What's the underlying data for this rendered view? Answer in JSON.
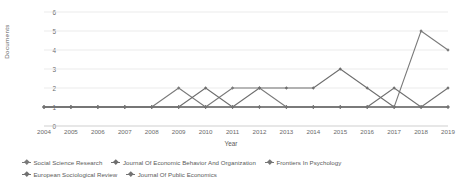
{
  "chart_data": {
    "type": "line",
    "title": "",
    "xlabel": "Year",
    "ylabel": "Documents",
    "x": [
      2004,
      2005,
      2006,
      2007,
      2008,
      2009,
      2010,
      2011,
      2012,
      2013,
      2014,
      2015,
      2016,
      2017,
      2018,
      2019
    ],
    "categories": [
      "2004",
      "2005",
      "2006",
      "2007",
      "2008",
      "2009",
      "2010",
      "2011",
      "2012",
      "2013",
      "2014",
      "2015",
      "2016",
      "2017",
      "2018",
      "2019"
    ],
    "ylim": [
      0,
      6
    ],
    "yticks": [
      0,
      1,
      2,
      3,
      4,
      5,
      6
    ],
    "xlim": [
      2004,
      2019
    ],
    "grid": "horizontal",
    "legend_position": "bottom",
    "marker": "diamond",
    "series": [
      {
        "name": "Social Science Research",
        "color": "#7a7a7a",
        "values": [
          1,
          1,
          1,
          1,
          1,
          2,
          1,
          2,
          2,
          1,
          1,
          1,
          1,
          1,
          5,
          4
        ]
      },
      {
        "name": "Journal Of Economic Behavior And Organization",
        "color": "#6e6e6e",
        "values": [
          1,
          1,
          1,
          1,
          1,
          1,
          2,
          1,
          2,
          2,
          2,
          3,
          2,
          1,
          1,
          1
        ]
      },
      {
        "name": "Frontiers In Psychology",
        "color": "#767676",
        "values": [
          1,
          1,
          1,
          1,
          1,
          1,
          1,
          1,
          1,
          1,
          1,
          1,
          1,
          1,
          1,
          1
        ]
      },
      {
        "name": "European Sociological Review",
        "color": "#707070",
        "values": [
          1,
          1,
          1,
          1,
          1,
          1,
          1,
          1,
          1,
          1,
          1,
          1,
          1,
          2,
          1,
          2
        ]
      },
      {
        "name": "Journal Of Public Economics",
        "color": "#737373",
        "values": [
          1,
          1,
          1,
          1,
          1,
          1,
          1,
          1,
          1,
          1,
          1,
          1,
          1,
          1,
          1,
          1
        ]
      }
    ]
  },
  "axes": {
    "y_title": "Documents",
    "x_title": "Year"
  },
  "colors": {
    "gridline": "#e3e3e3",
    "line": "#6f6f6f",
    "text": "#5a5a5a",
    "background": "#ffffff"
  }
}
